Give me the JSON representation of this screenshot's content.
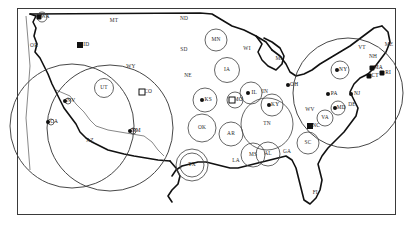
{
  "figure": {
    "type": "map",
    "title": "",
    "region": "United States",
    "background_color": "#ffffff",
    "border_color": "#3a3a3a",
    "coastline_color": "#111111",
    "circle_color": "#4a4a4a"
  },
  "chart_data": {
    "type": "scatter",
    "title": "",
    "xlabel": "",
    "ylabel": "",
    "encoding": "circle radius proportional to value",
    "states": [
      {
        "code": "WA",
        "x": 42,
        "y": 17,
        "radius": 5,
        "marker": "blob"
      },
      {
        "code": "OR",
        "x": 34,
        "y": 46,
        "radius": 0,
        "marker": "none"
      },
      {
        "code": "MT",
        "x": 114,
        "y": 21,
        "radius": 0,
        "marker": "none"
      },
      {
        "code": "ID",
        "x": 83,
        "y": 45,
        "radius": 0,
        "marker": "square"
      },
      {
        "code": "WY",
        "x": 131,
        "y": 67,
        "radius": 0,
        "marker": "none"
      },
      {
        "code": "ND",
        "x": 184,
        "y": 19,
        "radius": 0,
        "marker": "none"
      },
      {
        "code": "SD",
        "x": 184,
        "y": 50,
        "radius": 0,
        "marker": "none"
      },
      {
        "code": "NE",
        "x": 188,
        "y": 76,
        "radius": 0,
        "marker": "none"
      },
      {
        "code": "MN",
        "x": 216,
        "y": 40,
        "radius": 11,
        "marker": "none"
      },
      {
        "code": "IA",
        "x": 227,
        "y": 70,
        "radius": 12.5,
        "marker": "none"
      },
      {
        "code": "WI",
        "x": 247,
        "y": 49,
        "radius": 0,
        "marker": "none"
      },
      {
        "code": "MI",
        "x": 279,
        "y": 59,
        "radius": 0,
        "marker": "none"
      },
      {
        "code": "UT",
        "x": 104,
        "y": 88,
        "radius": 9.5,
        "marker": "none"
      },
      {
        "code": "NV",
        "x": 68,
        "y": 101,
        "radius": 3,
        "marker": "dot"
      },
      {
        "code": "CA",
        "x": 51,
        "y": 122,
        "radius": 3,
        "marker": "dot"
      },
      {
        "code": "CO",
        "x": 145,
        "y": 92,
        "radius": 0,
        "marker": "square-outline"
      },
      {
        "code": "AZ",
        "x": 90,
        "y": 141,
        "radius": 0,
        "marker": "none"
      },
      {
        "code": "NM",
        "x": 133,
        "y": 131,
        "radius": 3,
        "marker": "dot"
      },
      {
        "code": "KS",
        "x": 205,
        "y": 100,
        "radius": 12,
        "marker": "dot"
      },
      {
        "code": "MO",
        "x": 235,
        "y": 100,
        "radius": 8,
        "marker": "square-outline"
      },
      {
        "code": "OK",
        "x": 202,
        "y": 128,
        "radius": 14,
        "marker": "none"
      },
      {
        "code": "TX",
        "x": 192,
        "y": 165,
        "radius": 16,
        "marker": "ring"
      },
      {
        "code": "AR",
        "x": 231,
        "y": 134,
        "radius": 12,
        "marker": "none"
      },
      {
        "code": "LA",
        "x": 236,
        "y": 161,
        "radius": 0,
        "marker": "none"
      },
      {
        "code": "MS",
        "x": 253,
        "y": 155,
        "radius": 12,
        "marker": "none"
      },
      {
        "code": "AL",
        "x": 268,
        "y": 154,
        "radius": 12,
        "marker": "none"
      },
      {
        "code": "TN",
        "x": 267,
        "y": 124,
        "radius": 26,
        "marker": "none"
      },
      {
        "code": "KY",
        "x": 272,
        "y": 105,
        "radius": 11,
        "marker": "dot"
      },
      {
        "code": "IL",
        "x": 251,
        "y": 93,
        "radius": 11,
        "marker": "dot"
      },
      {
        "code": "IN",
        "x": 265,
        "y": 92,
        "radius": 0,
        "marker": "none"
      },
      {
        "code": "OH",
        "x": 291,
        "y": 85,
        "radius": 0,
        "marker": "dot"
      },
      {
        "code": "GA",
        "x": 287,
        "y": 152,
        "radius": 0,
        "marker": "none"
      },
      {
        "code": "SC",
        "x": 308,
        "y": 143,
        "radius": 11,
        "marker": "none"
      },
      {
        "code": "NC",
        "x": 313,
        "y": 126,
        "radius": 0,
        "marker": "square"
      },
      {
        "code": "WV",
        "x": 310,
        "y": 110,
        "radius": 0,
        "marker": "none"
      },
      {
        "code": "VA",
        "x": 325,
        "y": 118,
        "radius": 8,
        "marker": "none"
      },
      {
        "code": "MD",
        "x": 338,
        "y": 108,
        "radius": 7,
        "marker": "dot"
      },
      {
        "code": "DE",
        "x": 352,
        "y": 105,
        "radius": 0,
        "marker": "none"
      },
      {
        "code": "PA",
        "x": 331,
        "y": 94,
        "radius": 0,
        "marker": "dot"
      },
      {
        "code": "NJ",
        "x": 354,
        "y": 94,
        "radius": 0,
        "marker": "dot"
      },
      {
        "code": "NY",
        "x": 340,
        "y": 70,
        "radius": 9,
        "marker": "dot"
      },
      {
        "code": "VT",
        "x": 362,
        "y": 48,
        "radius": 0,
        "marker": "none"
      },
      {
        "code": "NH",
        "x": 373,
        "y": 57,
        "radius": 0,
        "marker": "none"
      },
      {
        "code": "ME",
        "x": 389,
        "y": 45,
        "radius": 0,
        "marker": "none"
      },
      {
        "code": "MA",
        "x": 375,
        "y": 68,
        "radius": 0,
        "marker": "blob"
      },
      {
        "code": "CT",
        "x": 372,
        "y": 76,
        "radius": 0,
        "marker": "blob"
      },
      {
        "code": "RI",
        "x": 385,
        "y": 73,
        "radius": 0,
        "marker": "blob"
      },
      {
        "code": "FL",
        "x": 316,
        "y": 193,
        "radius": 0,
        "marker": "none"
      }
    ],
    "big_circles": [
      {
        "name": "west-large-1",
        "cx": 72,
        "cy": 126,
        "r": 62
      },
      {
        "name": "west-large-2",
        "cx": 110,
        "cy": 128,
        "r": 63
      },
      {
        "name": "northeast-large",
        "cx": 348,
        "cy": 93,
        "r": 55
      }
    ]
  },
  "labels": {
    "WA": "WA",
    "OR": "OR",
    "MT": "MT",
    "ID": "ID",
    "WY": "WY",
    "ND": "ND",
    "SD": "SD",
    "NE": "NE",
    "MN": "MN",
    "IA": "IA",
    "WI": "WI",
    "MI": "MI",
    "UT": "UT",
    "NV": "NV",
    "CA": "CA",
    "CO": "CO",
    "AZ": "AZ",
    "NM": "NM",
    "KS": "KS",
    "MO": "MO",
    "OK": "OK",
    "TX": "TX",
    "AR": "AR",
    "LA": "LA",
    "MS": "MS",
    "AL": "AL",
    "TN": "TN",
    "KY": "KY",
    "IL": "IL",
    "IN": "IN",
    "OH": "OH",
    "GA": "GA",
    "SC": "SC",
    "NC": "NC",
    "WV": "WV",
    "VA": "VA",
    "MD": "MD",
    "DE": "DE",
    "PA": "PA",
    "NJ": "NJ",
    "NY": "NY",
    "VT": "VT",
    "NH": "NH",
    "ME": "ME",
    "MA": "MA",
    "CT": "CT",
    "RI": "RI",
    "FL": "FL"
  }
}
